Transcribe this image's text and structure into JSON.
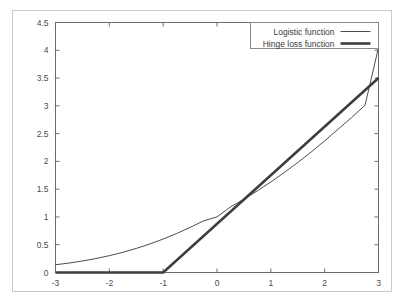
{
  "chart_data": {
    "type": "line",
    "title": "",
    "subtitle": "",
    "xlabel": "",
    "ylabel": "",
    "xlim": [
      -3,
      3
    ],
    "ylim": [
      0,
      4.5
    ],
    "grid": false,
    "legend_position": "top-right",
    "xticks": [
      "-3",
      "-2",
      "-1",
      "0",
      "1",
      "2",
      "3"
    ],
    "xtick_values": [
      -3,
      -2,
      -1,
      0,
      1,
      2,
      3
    ],
    "yticks": [
      "0",
      "0.5",
      "1",
      "1.5",
      "2",
      "2.5",
      "3",
      "3.5",
      "4",
      "4.5"
    ],
    "ytick_values": [
      0,
      0.5,
      1,
      1.5,
      2,
      2.5,
      3,
      3.5,
      4,
      4.5
    ],
    "series": [
      {
        "name": "Logistic function",
        "style": "thin",
        "color": "#4d4d4d",
        "x": [
          -3,
          -2.75,
          -2.5,
          -2.25,
          -2,
          -1.75,
          -1.5,
          -1.25,
          -1,
          -0.75,
          -0.5,
          -0.25,
          0,
          0.25,
          0.5,
          0.75,
          1,
          1.25,
          1.5,
          1.75,
          2,
          2.25,
          2.5,
          2.75,
          3
        ],
        "values": [
          0.139,
          0.17,
          0.207,
          0.251,
          0.303,
          0.363,
          0.433,
          0.513,
          0.602,
          0.702,
          0.811,
          0.929,
          1.0,
          1.18,
          1.32,
          1.47,
          1.63,
          1.8,
          1.98,
          2.17,
          2.37,
          2.58,
          2.79,
          3.01,
          4.05
        ]
      },
      {
        "name": "Hinge loss function",
        "style": "thick",
        "color": "#3d3d3d",
        "x": [
          -3,
          -1,
          3
        ],
        "values": [
          0,
          0,
          3.5
        ]
      }
    ],
    "legend": [
      {
        "label": "Logistic function",
        "style": "thin"
      },
      {
        "label": "Hinge loss function",
        "style": "thick"
      }
    ]
  }
}
